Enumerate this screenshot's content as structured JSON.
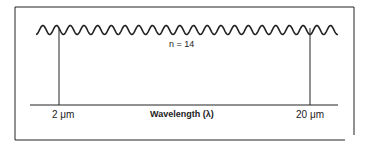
{
  "diagram": {
    "wave_label": "n = 14",
    "axis_label": "Wavelength (λ)",
    "left_marker": "2 μm",
    "right_marker": "20 μm",
    "colors": {
      "ink": "#222222",
      "background": "#ffffff"
    }
  }
}
